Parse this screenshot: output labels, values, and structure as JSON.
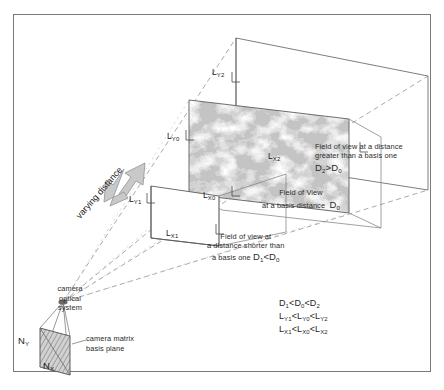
{
  "figure": {
    "border_color": "#7a7a7a",
    "background": "#ffffff",
    "ray_color": "#9a9a9a",
    "plane_color": "#6e6e6e",
    "arrow_fill": "#c9c9c9",
    "arrow_stroke": "#9b9b9b"
  },
  "labels": {
    "varying_distance": "varying distance",
    "l_y2": "L",
    "l_y2_sub": "Y2",
    "l_x2": "L",
    "l_x2_sub": "X2",
    "l_y0": "L",
    "l_y0_sub": "Y0",
    "l_x0": "L",
    "l_x0_sub": "X0",
    "l_y1": "L",
    "l_y1_sub": "Y1",
    "l_x1": "L",
    "l_x1_sub": "X1",
    "n_y": "N",
    "n_y_sub": "Y",
    "n_x": "N",
    "n_x_sub": "X"
  },
  "annotations": {
    "far": {
      "line1": "Field of view at a distance",
      "line2": "greater than a basis one",
      "formula_d": "D",
      "formula_sub1": "2",
      "formula_op": ">D",
      "formula_sub2": "0"
    },
    "basis": {
      "line1": "Field of View",
      "line2": "at a basis distance",
      "formula_d": "D",
      "formula_sub": "0"
    },
    "near": {
      "line1": "Field of view at",
      "line2": "a distance shorter than",
      "line3": "a basis one",
      "formula_d": "D",
      "formula_sub1": "1",
      "formula_op": "<D",
      "formula_sub2": "0"
    },
    "camera": {
      "line1": "camera",
      "line2": "optical",
      "line3": "system",
      "matrix_line1": "camera matrix",
      "matrix_line2": "basis plane"
    }
  },
  "inequalities": [
    {
      "a": "D",
      "a_sub": "1",
      "op1": "<D",
      "b_sub": "0",
      "op2": "<D",
      "c_sub": "2"
    },
    {
      "a": "L",
      "a_sub": "Y1",
      "op1": "<L",
      "b_sub": "Y0",
      "op2": "<L",
      "c_sub": "Y2"
    },
    {
      "a": "L",
      "a_sub": "X1",
      "op1": "<L",
      "b_sub": "X0",
      "op2": "<L",
      "c_sub": "X2"
    }
  ],
  "inequality_lines": [
    "D₁ <D₀ <D₂",
    "Lᵧ₁ <Lᵧ₀ <Lᵧ₂",
    "Lₓ₁ <Lₓ₀ <Lₓ₂"
  ],
  "geometry": {
    "apex": {
      "x": 63,
      "y": 302
    },
    "near_plane": {
      "label": "near field of view plane",
      "distance": "D1"
    },
    "basis_plane": {
      "label": "basis field of view plane (textured)",
      "distance": "D0"
    },
    "far_plane": {
      "label": "far field of view plane",
      "distance": "D2"
    }
  }
}
